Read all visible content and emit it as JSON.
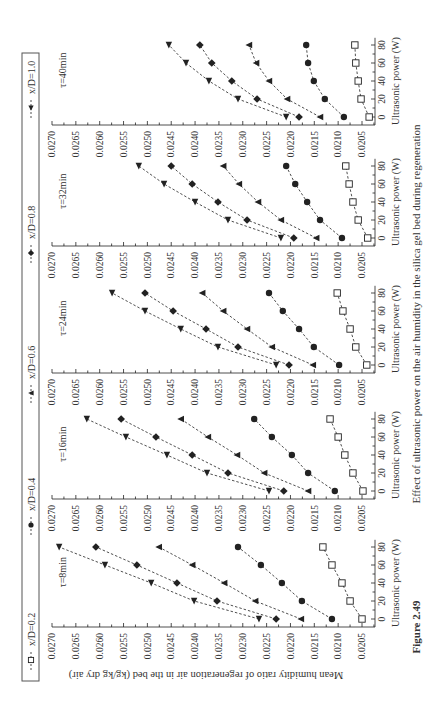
{
  "figure": {
    "label": "Figure 2.49",
    "caption": "Effect of ultrasonic power on the air humidity in the silica gel bed during regeneration"
  },
  "axes": {
    "xlabel": "Ultrasonic power (W)",
    "ylabel": "Mean humidity ratio of regeneration air in the bed (kg/kg dry air)",
    "xticks": [
      "0",
      "20",
      "40",
      "60",
      "80"
    ],
    "yticks": [
      "0.0270",
      "0.0265",
      "0.0260",
      "0.0255",
      "0.0250",
      "0.0245",
      "0.0240",
      "0.0235",
      "0.0230",
      "0.0225",
      "0.0220",
      "0.0215",
      "0.0210",
      "0.0205"
    ]
  },
  "legend": [
    {
      "label": "x/D=0.2",
      "marker": "open-square-icon"
    },
    {
      "label": "x/D=0.4",
      "marker": "filled-circle-icon"
    },
    {
      "label": "x/D=0.6",
      "marker": "filled-triangle-up-icon"
    },
    {
      "label": "x/D=0.8",
      "marker": "filled-diamond-icon"
    },
    {
      "label": "x/D=1.0",
      "marker": "filled-triangle-down-icon"
    }
  ],
  "colors": {
    "ink": "#222222",
    "frame": "#555555",
    "background": "#ffffff"
  },
  "chart_data": [
    {
      "type": "line",
      "title": "τ=8min",
      "x": [
        0,
        20,
        40,
        60,
        80
      ],
      "xlabel": "Ultrasonic power (W)",
      "ylabel": "Mean humidity ratio of regeneration air in the bed (kg/kg dry air)",
      "ylim": [
        0.0203,
        0.027
      ],
      "series": [
        {
          "name": "x/D=0.2",
          "values": [
            0.0205,
            0.02075,
            0.02092,
            0.02113,
            0.02132
          ]
        },
        {
          "name": "x/D=0.4",
          "values": [
            0.02113,
            0.02176,
            0.02218,
            0.02262,
            0.0231
          ]
        },
        {
          "name": "x/D=0.6",
          "values": [
            0.02178,
            0.02274,
            0.02339,
            0.02406,
            0.02476
          ]
        },
        {
          "name": "x/D=0.8",
          "values": [
            0.0223,
            0.02354,
            0.02438,
            0.02522,
            0.02608
          ]
        },
        {
          "name": "x/D=1.0",
          "values": [
            0.02266,
            0.02402,
            0.02492,
            0.02589,
            0.02685
          ]
        }
      ]
    },
    {
      "type": "line",
      "title": "τ=16min",
      "x": [
        0,
        20,
        40,
        60,
        80
      ],
      "xlabel": "Ultrasonic power (W)",
      "ylabel": "Mean humidity ratio of regeneration air in the bed (kg/kg dry air)",
      "ylim": [
        0.0203,
        0.027
      ],
      "series": [
        {
          "name": "x/D=0.2",
          "values": [
            0.02048,
            0.02069,
            0.02086,
            0.021,
            0.02117
          ]
        },
        {
          "name": "x/D=0.4",
          "values": [
            0.02107,
            0.02163,
            0.02197,
            0.02239,
            0.02276
          ]
        },
        {
          "name": "x/D=0.6",
          "values": [
            0.02163,
            0.02255,
            0.02312,
            0.02373,
            0.0243
          ]
        },
        {
          "name": "x/D=0.8",
          "values": [
            0.02214,
            0.02331,
            0.02406,
            0.02482,
            0.02555
          ]
        },
        {
          "name": "x/D=1.0",
          "values": [
            0.02245,
            0.02375,
            0.02459,
            0.02545,
            0.02627
          ]
        }
      ]
    },
    {
      "type": "line",
      "title": "τ=24min",
      "x": [
        0,
        20,
        40,
        60,
        80
      ],
      "xlabel": "Ultrasonic power (W)",
      "ylabel": "Mean humidity ratio of regeneration air in the bed (kg/kg dry air)",
      "ylim": [
        0.0203,
        0.027
      ],
      "series": [
        {
          "name": "x/D=0.2",
          "values": [
            0.0204,
            0.02063,
            0.02075,
            0.0209,
            0.02102
          ]
        },
        {
          "name": "x/D=0.4",
          "values": [
            0.02098,
            0.02151,
            0.02182,
            0.02216,
            0.02245
          ]
        },
        {
          "name": "x/D=0.6",
          "values": [
            0.02153,
            0.02239,
            0.02291,
            0.02341,
            0.02385
          ]
        },
        {
          "name": "x/D=0.8",
          "values": [
            0.02203,
            0.0231,
            0.02377,
            0.02446,
            0.02505
          ]
        },
        {
          "name": "x/D=1.0",
          "values": [
            0.0223,
            0.02352,
            0.0243,
            0.02505,
            0.02574
          ]
        }
      ]
    },
    {
      "type": "line",
      "title": "τ=32min",
      "x": [
        0,
        20,
        40,
        60,
        80
      ],
      "xlabel": "Ultrasonic power (W)",
      "ylabel": "Mean humidity ratio of regeneration air in the bed (kg/kg dry air)",
      "ylim": [
        0.0203,
        0.027
      ],
      "series": [
        {
          "name": "x/D=0.2",
          "values": [
            0.02038,
            0.02058,
            0.02069,
            0.02077,
            0.02084
          ]
        },
        {
          "name": "x/D=0.4",
          "values": [
            0.02092,
            0.02138,
            0.02165,
            0.0219,
            0.02209
          ]
        },
        {
          "name": "x/D=0.6",
          "values": [
            0.02146,
            0.0222,
            0.02268,
            0.02308,
            0.02341
          ]
        },
        {
          "name": "x/D=0.8",
          "values": [
            0.02193,
            0.02291,
            0.02352,
            0.02406,
            0.0245
          ]
        },
        {
          "name": "x/D=1.0",
          "values": [
            0.0222,
            0.02331,
            0.024,
            0.02465,
            0.02518
          ]
        }
      ]
    },
    {
      "type": "line",
      "title": "τ=40min",
      "x": [
        0,
        20,
        40,
        60,
        80
      ],
      "xlabel": "Ultrasonic power (W)",
      "ylabel": "Mean humidity ratio of regeneration air in the bed (kg/kg dry air)",
      "ylim": [
        0.0203,
        0.027
      ],
      "series": [
        {
          "name": "x/D=0.2",
          "values": [
            0.02035,
            0.02052,
            0.02058,
            0.02063,
            0.02065
          ]
        },
        {
          "name": "x/D=0.4",
          "values": [
            0.02088,
            0.02128,
            0.02151,
            0.02163,
            0.02167
          ]
        },
        {
          "name": "x/D=0.6",
          "values": [
            0.02138,
            0.02207,
            0.02245,
            0.02272,
            0.02287
          ]
        },
        {
          "name": "x/D=0.8",
          "values": [
            0.02182,
            0.0227,
            0.02323,
            0.02365,
            0.0239
          ]
        },
        {
          "name": "x/D=1.0",
          "values": [
            0.02209,
            0.0231,
            0.02371,
            0.02419,
            0.02455
          ]
        }
      ]
    }
  ]
}
